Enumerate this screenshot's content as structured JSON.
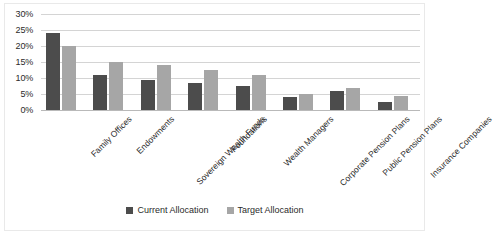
{
  "chart_data": {
    "type": "bar",
    "title": "",
    "subtitle": "",
    "xlabel": "",
    "ylabel": "",
    "ylim": [
      0,
      30
    ],
    "y_tick_labels": [
      "30%",
      "25%",
      "20%",
      "15%",
      "10%",
      "5%",
      "0%"
    ],
    "y_tick_values": [
      30,
      25,
      20,
      15,
      10,
      5,
      0
    ],
    "grid": true,
    "legend_position": "bottom",
    "categories": [
      "Family Offices",
      "Endowments",
      "Sovereign Wealth Funds",
      "Foundations",
      "Wealth Managers",
      "Corporate Pension Plans",
      "Public Pension Plans",
      "Insurance Companies"
    ],
    "series": [
      {
        "name": "Current Allocation",
        "color": "#4c4c4c",
        "values": [
          24,
          11,
          9.5,
          8.5,
          7.5,
          4,
          6,
          2.5
        ]
      },
      {
        "name": "Target Allocation",
        "color": "#a6a6a6",
        "values": [
          20,
          15,
          14,
          12.5,
          11,
          5,
          7,
          4.5
        ]
      }
    ]
  },
  "legend": {
    "items": [
      {
        "label": "Current Allocation",
        "color": "#4c4c4c"
      },
      {
        "label": "Target Allocation",
        "color": "#a6a6a6"
      }
    ]
  }
}
